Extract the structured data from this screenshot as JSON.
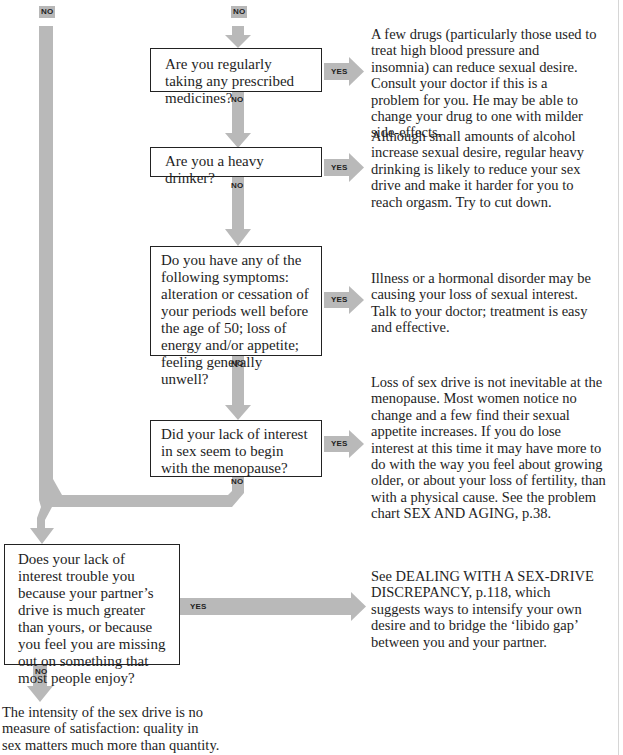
{
  "colors": {
    "arrow_fill": "#b9b9b9",
    "box_border": "#222222",
    "text": "#1e1e1e",
    "background": "#ffffff"
  },
  "labels": {
    "no": "NO",
    "yes": "YES"
  },
  "questions": [
    {
      "id": "q1",
      "text": "Are you regularly taking any prescribed medicines?"
    },
    {
      "id": "q2",
      "text": "Are you a heavy drinker?"
    },
    {
      "id": "q3",
      "text": "Do you have any of the following symptoms: alteration or cessation of your periods well before the age of 50; loss of energy and/or appetite; feeling generally unwell?"
    },
    {
      "id": "q4",
      "text": "Did your lack of interest in sex seem to begin with the menopause?"
    },
    {
      "id": "q5",
      "text": "Does your lack of interest trouble you because your partner’s drive is much greater than yours, or because you feel you are missing out on something that most people enjoy?"
    }
  ],
  "answers": [
    {
      "id": "a1",
      "text": "A few drugs (particularly those used to treat high blood pressure and insomnia) can reduce sexual desire. Consult your doctor if this is a problem for you. He may be able to change your drug to one with milder side-effects."
    },
    {
      "id": "a2",
      "text": "Although small amounts of alcohol increase sexual desire, regular heavy drinking is likely to reduce your sex drive and make it harder for you to reach orgasm. Try to cut down."
    },
    {
      "id": "a3",
      "text": "Illness or a hormonal disorder may be causing your loss of sexual interest. Talk to your doctor; treatment is easy and effective."
    },
    {
      "id": "a4",
      "text": "Loss of sex drive is not inevitable at the menopause. Most women notice no change and a few find their sexual appetite increases. If you do lose interest at this time it may have more to do with the way you feel about growing older, or about your loss of fertility, than with a physical cause. See the problem chart SEX AND AGING, p.38."
    },
    {
      "id": "a5",
      "text": "See DEALING WITH A SEX-DRIVE DISCREPANCY, p.118, which suggests ways to intensify your own desire and to bridge the ‘libido gap’ between you and your partner."
    },
    {
      "id": "a6",
      "text": "The intensity of the sex drive is no measure of satisfaction: quality in sex matters much more than quantity."
    }
  ]
}
